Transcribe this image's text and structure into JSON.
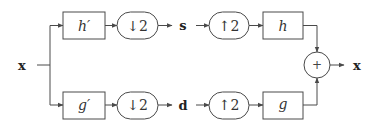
{
  "diagram": {
    "type": "two-channel filter bank",
    "input_label": "x",
    "output_label": "x",
    "analysis": {
      "top_filter": "h′",
      "bottom_filter": "g′",
      "top_downsample": "↓2",
      "bottom_downsample": "↓2"
    },
    "signals": {
      "top": "s",
      "bottom": "d"
    },
    "synthesis": {
      "top_upsample": "↑2",
      "bottom_upsample": "↑2",
      "top_filter": "h",
      "bottom_filter": "g"
    },
    "adder": "+",
    "colors": {
      "stroke": "#4a4a4a",
      "text": "#333333",
      "background": "#ffffff"
    }
  }
}
